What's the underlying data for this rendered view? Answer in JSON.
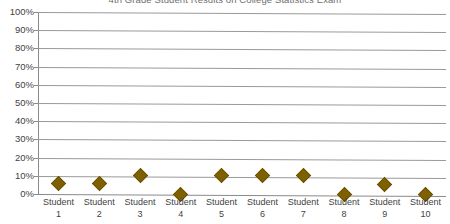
{
  "chart_data": {
    "type": "scatter",
    "title": "4th Grade Student Results on College Statistics Exam",
    "xlabel": "",
    "ylabel": "",
    "categories": [
      "Student 1",
      "Student 2",
      "Student 3",
      "Student 4",
      "Student 5",
      "Student 6",
      "Student 7",
      "Student 8",
      "Student 9",
      "Student 10"
    ],
    "category_lines": [
      [
        "Student",
        "1"
      ],
      [
        "Student",
        "2"
      ],
      [
        "Student",
        "3"
      ],
      [
        "Student",
        "4"
      ],
      [
        "Student",
        "5"
      ],
      [
        "Student",
        "6"
      ],
      [
        "Student",
        "7"
      ],
      [
        "Student",
        "8"
      ],
      [
        "Student",
        "9"
      ],
      [
        "Student",
        "10"
      ]
    ],
    "values": [
      6,
      6,
      10,
      0,
      10,
      10,
      10,
      0,
      5,
      0
    ],
    "ylim": [
      0,
      100
    ],
    "ytick_labels": [
      "100%",
      "90%",
      "80%",
      "70%",
      "60%",
      "50%",
      "40%",
      "30%",
      "20%",
      "10%",
      "0%"
    ],
    "ytick_values": [
      100,
      90,
      80,
      70,
      60,
      50,
      40,
      30,
      20,
      10,
      0
    ],
    "grid": true,
    "legend": "none",
    "marker_shape": "diamond",
    "marker_color": "#7f6000",
    "gridline_color": "#9a9a9a",
    "axis_color": "#8a8a8a",
    "title_color": "#555555",
    "label_color": "#3f3f3f"
  }
}
